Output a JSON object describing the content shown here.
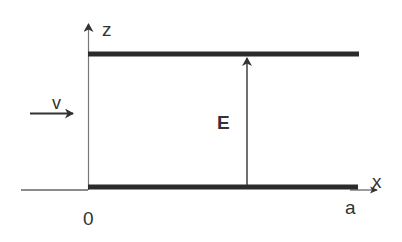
{
  "diagram": {
    "type": "parallel-plate-capacitor",
    "labels": {
      "z_axis": "z",
      "x_axis": "x",
      "origin": "0",
      "plate_length": "a",
      "field": "E",
      "velocity": "v"
    },
    "colors": {
      "plate": "#2b2b2b",
      "axis": "#555555",
      "arrow": "#333333",
      "text": "#333333",
      "background": "#ffffff"
    },
    "elements": [
      {
        "id": "top-plate",
        "kind": "thick-line",
        "description": "upper capacitor plate"
      },
      {
        "id": "bottom-plate",
        "kind": "thick-line",
        "description": "lower capacitor plate along x-axis"
      },
      {
        "id": "z-axis",
        "kind": "arrow",
        "label": "z"
      },
      {
        "id": "x-axis",
        "kind": "arrow",
        "label": "x"
      },
      {
        "id": "field-arrow",
        "kind": "arrow",
        "label": "E",
        "direction": "up"
      },
      {
        "id": "velocity-arrow",
        "kind": "arrow",
        "label": "v",
        "direction": "right"
      }
    ]
  }
}
